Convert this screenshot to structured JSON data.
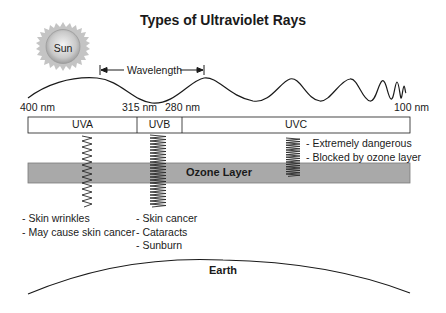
{
  "title": "Types of Ultraviolet Rays",
  "sun": {
    "label": "Sun",
    "icon": "sun-icon"
  },
  "wavelength": {
    "label": "Wavelength",
    "icon": "double-arrow-icon"
  },
  "scale": {
    "ticks": [
      {
        "label": "400 nm",
        "x": 20
      },
      {
        "label": "315 nm",
        "x": 122
      },
      {
        "label": "280 nm",
        "x": 165
      },
      {
        "label": "100 nm",
        "x": 394
      }
    ]
  },
  "bands": [
    {
      "name": "UVA",
      "range_nm": [
        400,
        315
      ]
    },
    {
      "name": "UVB",
      "range_nm": [
        315,
        280
      ]
    },
    {
      "name": "UVC",
      "range_nm": [
        280,
        100
      ]
    }
  ],
  "ozone": {
    "label": "Ozone Layer",
    "color": "#a9a9a9"
  },
  "effects": {
    "uva": [
      "- Skin wrinkles",
      "- May cause skin cancer"
    ],
    "uvb": [
      "- Skin cancer",
      "- Cataracts",
      "- Sunburn"
    ],
    "uvc": [
      "- Extremely dangerous",
      "- Blocked by ozone layer"
    ]
  },
  "earth": {
    "label": "Earth"
  },
  "colors": {
    "line": "#1a1a1a",
    "ozone_fill": "#a9a9a9",
    "sun_core": "#bdbdbd",
    "sun_rays": "#c8c8c8"
  }
}
